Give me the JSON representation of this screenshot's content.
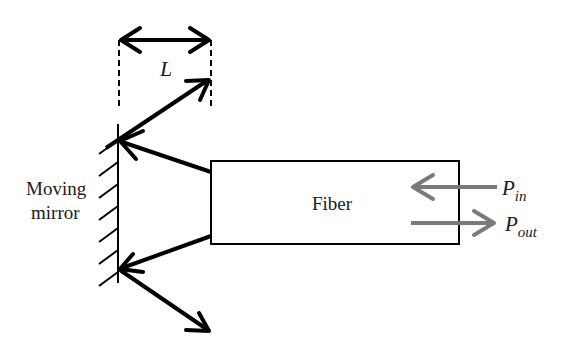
{
  "diagram": {
    "labels": {
      "length": "L",
      "mirror_line1": "Moving",
      "mirror_line2": "mirror",
      "fiber": "Fiber",
      "p_in_main": "P",
      "p_in_sub": "in",
      "p_out_main": "P",
      "p_out_sub": "out"
    },
    "colors": {
      "line": "#000000",
      "signal_arrows": "#7a7a7a",
      "text": "#1a1a1a"
    }
  }
}
